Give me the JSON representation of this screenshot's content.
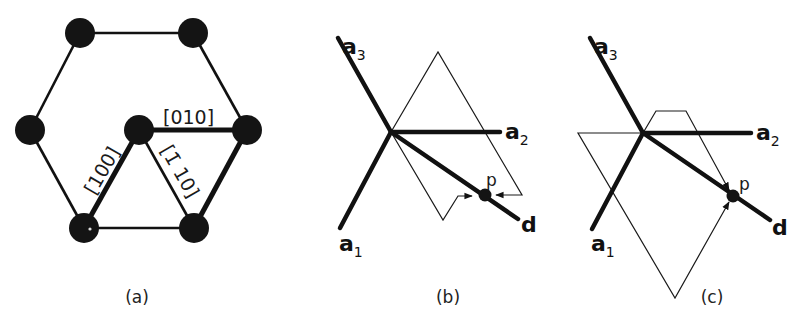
{
  "panels": [
    {
      "id": "a",
      "caption": "(a)",
      "description": "Hexagonal lattice of atoms with three labeled directions",
      "directions": [
        {
          "label": "[010]"
        },
        {
          "label": "[100]"
        },
        {
          "label": "[1̄ 10]"
        }
      ],
      "atom_count": 7
    },
    {
      "id": "b",
      "caption": "(b)",
      "axes": {
        "a1": "a",
        "a1_sub": "1",
        "a2": "a",
        "a2_sub": "2",
        "a3": "a",
        "a3_sub": "3",
        "d": "d"
      },
      "point": "p"
    },
    {
      "id": "c",
      "caption": "(c)",
      "axes": {
        "a1": "a",
        "a1_sub": "1",
        "a2": "a",
        "a2_sub": "2",
        "a3": "a",
        "a3_sub": "3",
        "d": "d"
      },
      "point": "p"
    }
  ],
  "colors": {
    "ink": "#111111",
    "background": "#ffffff"
  }
}
